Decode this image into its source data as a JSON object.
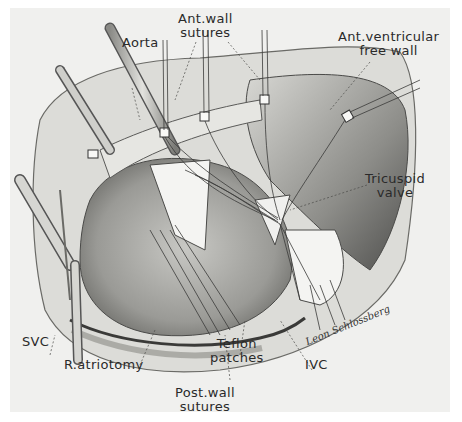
{
  "figure": {
    "type": "surgical illustration",
    "style": "grayscale pencil drawing",
    "colors": {
      "background": "#ffffff",
      "paper": "#f0f0ee",
      "ink": "#2a2a2a",
      "tissue_light": "#d9d9d6",
      "tissue_mid": "#a9a9a6",
      "tissue_dark": "#5a5a58",
      "patch": "#f4f4f2"
    }
  },
  "labels": {
    "aorta": "Aorta",
    "ant_wall_sutures_line1": "Ant.wall",
    "ant_wall_sutures_line2": "sutures",
    "ant_ventricular_line1": "Ant.ventricular",
    "ant_ventricular_line2": "free wall",
    "tricuspid_line1": "Tricuspid",
    "tricuspid_line2": "valve",
    "svc": "SVC",
    "r_atriotomy": "R.atriotomy",
    "teflon_line1": "Teflon",
    "teflon_line2": "patches",
    "ivc": "IVC",
    "post_wall_line1": "Post.wall",
    "post_wall_line2": "sutures"
  },
  "signature": "Leon Schlossberg"
}
